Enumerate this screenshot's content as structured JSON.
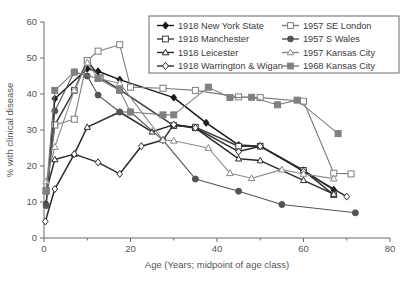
{
  "chart_data": {
    "type": "line",
    "title": "",
    "xlabel": "Age (Years; midpoint of age class)",
    "ylabel": "% with clinical disease",
    "xlim": [
      0,
      80
    ],
    "ylim": [
      0,
      60
    ],
    "xticks": [
      0,
      20,
      40,
      60,
      80
    ],
    "xticklabels": [
      "0",
      "20",
      "40",
      "60",
      "80"
    ],
    "xminorticks": [
      10,
      30,
      50,
      70
    ],
    "yticks": [
      0,
      10,
      20,
      30,
      40,
      50,
      60
    ],
    "yticklabels": [
      "0",
      "10",
      "20",
      "30",
      "40",
      "50",
      "60"
    ],
    "grid": false,
    "legend_position": "top-right-inside",
    "series": [
      {
        "name": "1918 New York State",
        "color": "#1a1a1a",
        "marker": "diamond-filled",
        "x": [
          0.5,
          2.5,
          10,
          12.5,
          17.5,
          30,
          37.5,
          45,
          50,
          60,
          67
        ],
        "y": [
          9.5,
          38.7,
          47.0,
          46.3,
          44.0,
          39.0,
          32.0,
          25.8,
          25.5,
          18.8,
          13.4
        ]
      },
      {
        "name": "1918 Manchester",
        "color": "#3a3a3a",
        "marker": "square-open",
        "x": [
          0.5,
          2.5,
          7,
          10,
          13,
          17.5,
          30,
          35,
          45,
          50,
          60,
          67
        ],
        "y": [
          13.2,
          31.4,
          41.0,
          49.3,
          44.5,
          41.2,
          31.2,
          30.8,
          25.5,
          25.5,
          18.8,
          12.0
        ]
      },
      {
        "name": "1918 Leicester",
        "color": "#2b2b2b",
        "marker": "triangle-open",
        "x": [
          0.5,
          2.5,
          7,
          10,
          17.5,
          25,
          30,
          35,
          45,
          50,
          60,
          67
        ],
        "y": [
          13.0,
          21.8,
          23.3,
          30.8,
          35.0,
          29.5,
          31.5,
          30.5,
          22.0,
          21.5,
          16.0,
          12.2
        ]
      },
      {
        "name": "1918 Warrington & Wigan",
        "color": "#2b2b2b",
        "marker": "diamond-open",
        "x": [
          0.3,
          2.5,
          7,
          12.5,
          17.5,
          22.5,
          27.5,
          30,
          35,
          45,
          50,
          60,
          70
        ],
        "y": [
          4.6,
          13.6,
          23.3,
          21.0,
          17.8,
          25.5,
          27.2,
          31.5,
          30.6,
          24.0,
          25.5,
          18.5,
          11.5
        ]
      },
      {
        "name": "1957 SE London",
        "color": "#7d7d7d",
        "marker": "square-open",
        "x": [
          0.5,
          2.5,
          7,
          10,
          12.5,
          17.5,
          20,
          27.5,
          35,
          45,
          50,
          60,
          67,
          71
        ],
        "y": [
          13.2,
          31.4,
          33.0,
          49.3,
          51.9,
          53.7,
          41.9,
          41.6,
          41.0,
          39.2,
          39.0,
          38.0,
          18.0,
          17.8
        ]
      },
      {
        "name": "1957 S Wales",
        "color": "#545454",
        "marker": "circle-filled",
        "x": [
          0.5,
          2.5,
          7,
          10,
          12.5,
          17.5,
          20,
          27.5,
          35,
          45,
          55,
          72
        ],
        "y": [
          9.0,
          35.3,
          46.1,
          45.0,
          39.7,
          35.0,
          35.0,
          27.2,
          16.4,
          13.0,
          9.3,
          7.0
        ]
      },
      {
        "name": "1957 Kansas City",
        "color": "#8a8a8a",
        "marker": "triangle-open",
        "x": [
          0.5,
          2.5,
          7,
          10,
          12.5,
          17.5,
          27.5,
          30,
          38,
          43,
          48,
          55,
          60,
          67
        ],
        "y": [
          15.7,
          25.3,
          41.0,
          48.7,
          44.3,
          43.0,
          27.2,
          27.0,
          25.0,
          18.0,
          16.6,
          19.0,
          17.8,
          16.5
        ]
      },
      {
        "name": "1968 Kansas City",
        "color": "#808080",
        "marker": "square-filled",
        "x": [
          0.5,
          2.5,
          7,
          12.5,
          17.5,
          20,
          27.5,
          30,
          38,
          43,
          48,
          54,
          58.5,
          68
        ],
        "y": [
          13.0,
          41.0,
          46.1,
          44.3,
          41.0,
          35.0,
          34.2,
          34.2,
          41.9,
          39.0,
          39.1,
          37.0,
          38.3,
          29.0
        ]
      }
    ],
    "legend": [
      {
        "label": "1918 New York State",
        "color": "#1a1a1a",
        "marker": "diamond-filled"
      },
      {
        "label": "1957 SE London",
        "color": "#7d7d7d",
        "marker": "square-open"
      },
      {
        "label": "1918 Manchester",
        "color": "#3a3a3a",
        "marker": "square-open"
      },
      {
        "label": "1957 S Wales",
        "color": "#545454",
        "marker": "circle-filled"
      },
      {
        "label": "1918 Leicester",
        "color": "#2b2b2b",
        "marker": "triangle-open"
      },
      {
        "label": "1957 Kansas City",
        "color": "#8a8a8a",
        "marker": "triangle-open"
      },
      {
        "label": "1918 Warrington & Wigan",
        "color": "#2b2b2b",
        "marker": "diamond-open"
      },
      {
        "label": "1968 Kansas City",
        "color": "#808080",
        "marker": "square-filled"
      }
    ]
  }
}
